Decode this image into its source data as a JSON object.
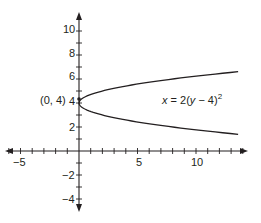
{
  "chart_data": {
    "type": "line",
    "title": "",
    "equation": "x = 2(y − 4)²",
    "equation_parts": {
      "lhs": "x",
      "eq": " = 2(",
      "var": "y",
      "rest": " − 4)",
      "exp": "2"
    },
    "xlabel": "",
    "ylabel": "",
    "xlim": [
      -6.1,
      14.2
    ],
    "ylim": [
      -5,
      11.3
    ],
    "x_ticks_major_labels": [
      "-5",
      "5",
      "10"
    ],
    "x_tick_values_labeled": [
      -5,
      5,
      10
    ],
    "y_ticks_major_labels": [
      "10",
      "8",
      "6",
      "4",
      "2",
      "-2",
      "-4"
    ],
    "y_tick_values_labeled": [
      10,
      8,
      6,
      4,
      2,
      -2,
      -4
    ],
    "minor_tick_step": 1,
    "grid": false,
    "vertex": {
      "x": 0,
      "y": 4,
      "label": "(0, 4)"
    },
    "series": [
      {
        "name": "x = 2(y − 4)²",
        "description": "Sideways parabola opening right",
        "points": [
          {
            "x": 13.6,
            "y": 6.6
          },
          {
            "x": 8,
            "y": 6
          },
          {
            "x": 2,
            "y": 5
          },
          {
            "x": 0.5,
            "y": 4.5
          },
          {
            "x": 0,
            "y": 4
          },
          {
            "x": 0.5,
            "y": 3.5
          },
          {
            "x": 2,
            "y": 3
          },
          {
            "x": 8,
            "y": 2
          },
          {
            "x": 13.6,
            "y": 1.4
          }
        ]
      }
    ],
    "annotations": [
      {
        "text": "(0, 4)",
        "x": 0,
        "y": 4
      },
      {
        "text": "x = 2(y − 4)²",
        "x": 6.5,
        "y": 4
      }
    ]
  },
  "labels": {
    "x_neg5": "−5",
    "x_5": "5",
    "x_10": "10",
    "y_10": "10",
    "y_8": "8",
    "y_6": "6",
    "y_4": "4",
    "y_2": "2",
    "y_neg2": "−2",
    "y_neg4": "−4",
    "vertex": "(0, 4)",
    "eq_lhs": "x",
    "eq_mid": " = 2(",
    "eq_var": "y",
    "eq_end": " − 4)",
    "eq_exp": "2"
  },
  "colors": {
    "ink": "#231f20",
    "background": "#ffffff"
  }
}
